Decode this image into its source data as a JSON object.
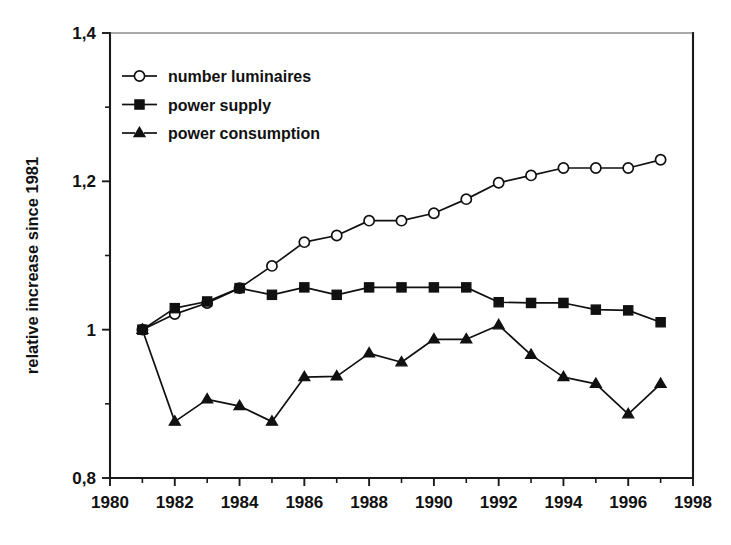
{
  "chart_data": {
    "type": "line",
    "title": "",
    "subtitle": "",
    "xlabel": "",
    "ylabel": "relative increase since 1981",
    "xlim": [
      1980,
      1998
    ],
    "ylim": [
      0.8,
      1.4
    ],
    "grid": false,
    "legend_position": "top-left",
    "x_tick_labels": [
      "1980",
      "1982",
      "1984",
      "1986",
      "1988",
      "1990",
      "1992",
      "1994",
      "1996",
      "1998"
    ],
    "x_tick_values": [
      1980,
      1982,
      1984,
      1986,
      1988,
      1990,
      1992,
      1994,
      1996,
      1998
    ],
    "x_minor_tick_values": [
      1981,
      1983,
      1985,
      1987,
      1989,
      1991,
      1993,
      1995,
      1997
    ],
    "y_tick_labels": [
      "1,4",
      "1,2",
      "1",
      "0,8"
    ],
    "y_tick_values": [
      1.4,
      1.2,
      1.0,
      0.8
    ],
    "y_minor_tick_values": [
      1.3,
      1.1,
      0.9
    ],
    "x": [
      1981,
      1982,
      1983,
      1984,
      1985,
      1986,
      1987,
      1988,
      1989,
      1990,
      1991,
      1992,
      1993,
      1994,
      1995,
      1996,
      1997
    ],
    "series": [
      {
        "name": "number luminaires",
        "marker": "open-circle",
        "values": [
          1.0,
          1.021,
          1.036,
          1.056,
          1.086,
          1.118,
          1.127,
          1.147,
          1.147,
          1.157,
          1.176,
          1.198,
          1.208,
          1.218,
          1.218,
          1.218,
          1.229
        ]
      },
      {
        "name": "power supply",
        "marker": "filled-square",
        "values": [
          1.0,
          1.029,
          1.038,
          1.056,
          1.047,
          1.057,
          1.047,
          1.057,
          1.057,
          1.057,
          1.057,
          1.037,
          1.036,
          1.036,
          1.027,
          1.026,
          1.01
        ]
      },
      {
        "name": "power consumption",
        "marker": "filled-triangle",
        "values": [
          1.0,
          0.876,
          0.906,
          0.897,
          0.876,
          0.936,
          0.937,
          0.968,
          0.956,
          0.987,
          0.987,
          1.006,
          0.966,
          0.936,
          0.927,
          0.886,
          0.927
        ]
      }
    ]
  },
  "legend": {
    "items": [
      {
        "label": "number luminaires",
        "marker": "open-circle"
      },
      {
        "label": "power supply",
        "marker": "filled-square"
      },
      {
        "label": "power consumption",
        "marker": "filled-triangle"
      }
    ]
  }
}
